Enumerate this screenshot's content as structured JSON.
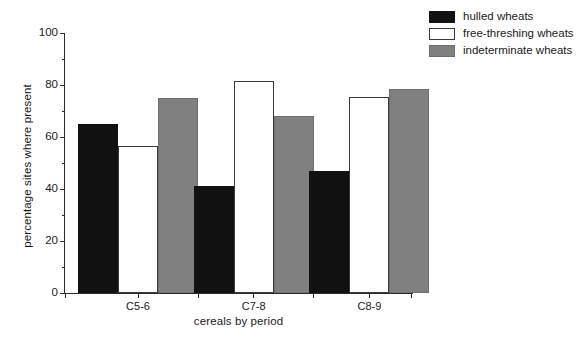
{
  "chart_data": {
    "type": "bar",
    "title": "",
    "subtitle": "",
    "xlabel": "cereals by period",
    "ylabel": "percentage sites where present",
    "categories": [
      "C5-6",
      "C7-8",
      "C8-9"
    ],
    "series": [
      {
        "name": "hulled wheats",
        "color": "#111111",
        "values": [
          65,
          41,
          47
        ]
      },
      {
        "name": "free-threshing wheats",
        "color": "#ffffff",
        "values": [
          56.5,
          81.5,
          75.5
        ]
      },
      {
        "name": "indeterminate wheats",
        "color": "#808080",
        "values": [
          75,
          68,
          78.5
        ]
      }
    ],
    "ylim": [
      0,
      100
    ],
    "y_ticks": [
      0,
      20,
      40,
      60,
      80,
      100
    ],
    "y_tick_labels": [
      "0",
      "20",
      "40",
      "60",
      "80",
      "100"
    ],
    "y_minor_ticks": [
      10,
      30,
      50,
      70,
      90
    ],
    "grid": false,
    "legend_position": "top-right",
    "legend_entries": [
      "hulled wheats",
      "free-threshing wheats",
      "indeterminate wheats"
    ]
  }
}
